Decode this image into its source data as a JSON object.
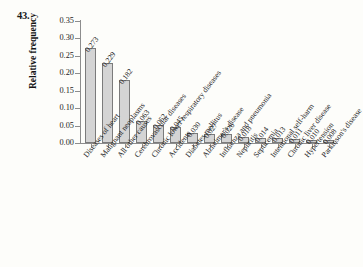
{
  "figure": {
    "problem_number": "43."
  },
  "chart_data": {
    "type": "bar",
    "title": "",
    "xlabel": "",
    "ylabel": "Relative frequency",
    "ylim": [
      0,
      0.35
    ],
    "grid": false,
    "legend": "none",
    "ytick_labels": [
      "0.00",
      "0.05",
      "0.10",
      "0.15",
      "0.20",
      "0.25",
      "0.30",
      "0.35"
    ],
    "ytick_values": [
      0.0,
      0.05,
      0.1,
      0.15,
      0.2,
      0.25,
      0.3,
      0.35
    ],
    "categories": [
      "Diseases of heart",
      "Malignant neoplasms",
      "All other causes",
      "Cerebrovascular diseases",
      "Chronic lower respiratory diseases",
      "Accidents",
      "Diabetes mellitus",
      "Alzheimer's disease",
      "Influenza and pneumonia",
      "Nephritis",
      "Septicemia",
      "Intentional self-harm",
      "Chronic liver disease",
      "Hypertension",
      "Parkinson's disease"
    ],
    "values": [
      0.273,
      0.229,
      0.182,
      0.063,
      0.052,
      0.045,
      0.03,
      0.027,
      0.026,
      0.018,
      0.014,
      0.013,
      0.011,
      0.01,
      0.008
    ],
    "value_labels": [
      "0.273",
      "0.229",
      "0.182",
      "0.063",
      "0.052",
      "0.045",
      "0.030",
      "0.027",
      "0.026",
      "0.018",
      "0.014",
      "0.013",
      "0.011",
      "0.010",
      "0.008"
    ],
    "bar_fill_color": "#d4d4d4",
    "bar_edge_color": "#7b7b7b",
    "axis_color": "#8d8d8d",
    "background_color": "#fdfdfa"
  }
}
